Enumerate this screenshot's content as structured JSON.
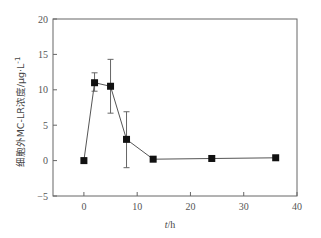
{
  "chart_data": {
    "type": "line",
    "title": "",
    "xlabel": "t/h",
    "xlabel_italic_part": "t",
    "xlabel_unit": "/h",
    "ylabel": "细胞外MC-LR浓度/μg·L⁻¹",
    "ylabel_main": "细胞外MC-LR浓度/μg·L",
    "ylabel_sup": "-1",
    "xlim": [
      -5.8,
      40
    ],
    "ylim": [
      -5,
      20
    ],
    "xticks": [
      0,
      10,
      20,
      30,
      40
    ],
    "xtick_labels": [
      "0",
      "10",
      "20",
      "30",
      "40"
    ],
    "yticks": [
      -5,
      0,
      5,
      10,
      15,
      20
    ],
    "ytick_labels": [
      "−5",
      "0",
      "5",
      "10",
      "15",
      "20"
    ],
    "grid": false,
    "legend": null,
    "marker": "square",
    "series": [
      {
        "name": "extracellular MC-LR",
        "x": [
          0,
          2,
          5,
          8,
          13,
          24,
          36
        ],
        "y": [
          0,
          11.0,
          10.5,
          3.0,
          0.2,
          0.3,
          0.4
        ],
        "error": [
          null,
          [
            9.8,
            12.4
          ],
          [
            6.7,
            14.3
          ],
          [
            -1.0,
            6.9
          ],
          null,
          null,
          null
        ]
      }
    ],
    "colors": {
      "line": "#555555",
      "marker": "#111111",
      "axis": "#666666"
    }
  }
}
